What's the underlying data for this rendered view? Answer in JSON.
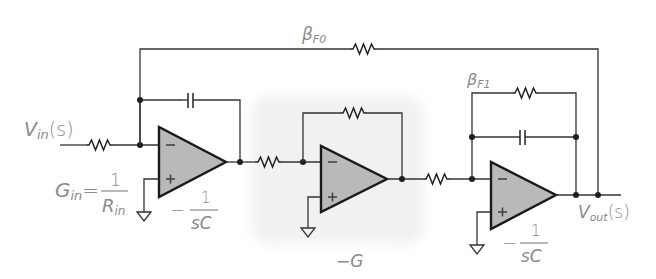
{
  "diagram": {
    "type": "circuit-schematic",
    "colors": {
      "wire": "#333333",
      "opamp_fill": "#b9b9b9",
      "opamp_stroke": "#1a1a1a",
      "label_text": "#8a8a8a",
      "shade_box": "#f3f3f3"
    },
    "labels": {
      "vin": "V",
      "vin_sub": "in",
      "vin_arg": "(s)",
      "gin": "G",
      "gin_sub": "in",
      "gin_eq": "=",
      "gin_num": "1",
      "gin_den": "R",
      "gin_den_sub": "in",
      "int1_sign": "−",
      "int1_num": "1",
      "int1_den": "sC",
      "inv_gain": "−G",
      "int2_sign": "−",
      "int2_num": "1",
      "int2_den": "sC",
      "beta_f0": "β",
      "beta_f0_sub": "F0",
      "beta_f1": "β",
      "beta_f1_sub": "F1",
      "vout": "V",
      "vout_sub": "out",
      "vout_arg": "(s)"
    },
    "components": {
      "input_resistor": "resistor",
      "integrator1_capacitor": "capacitor",
      "integrator1_opamp": "op-amp",
      "coupling_resistor_1": "resistor",
      "inverter_feedback_resistor": "resistor",
      "inverter_opamp": "op-amp",
      "coupling_resistor_2": "resistor",
      "beta_f1_resistor": "resistor",
      "integrator2_capacitor": "capacitor",
      "integrator2_opamp": "op-amp",
      "beta_f0_resistor": "resistor"
    },
    "opamp_terminals": {
      "inverting": "−",
      "noninverting": "+"
    }
  }
}
